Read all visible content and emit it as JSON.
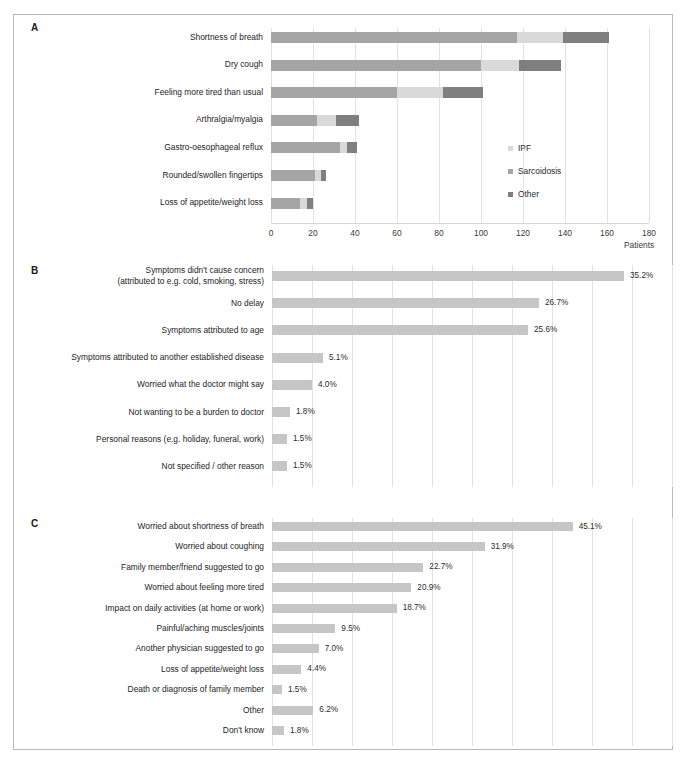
{
  "figure": {
    "background": "#ffffff",
    "border_color": "#b9b9b9"
  },
  "panels": {
    "a": {
      "letter": "A"
    },
    "b": {
      "letter": "B"
    },
    "c": {
      "letter": "C"
    }
  },
  "colors": {
    "ipf": "#d9d9d9",
    "sarcoidosis": "#a5a5a5",
    "other": "#7f7f7f",
    "single_bar": "#c6c6c6",
    "gridline": "#e2e2e2",
    "axis": "#d6d6d6",
    "text": "#252525"
  },
  "legend": {
    "items": [
      {
        "label": "IPF",
        "color": "#d9d9d9"
      },
      {
        "label": "Sarcoidosis",
        "color": "#a5a5a5"
      },
      {
        "label": "Other",
        "color": "#7f7f7f"
      }
    ]
  },
  "chart_data": [
    {
      "panel": "A",
      "type": "bar",
      "orientation": "horizontal",
      "stacked": true,
      "title": "",
      "xlabel": "Patients",
      "ylabel": "",
      "xlim": [
        0,
        180
      ],
      "xticks": [
        0,
        20,
        40,
        60,
        80,
        100,
        120,
        140,
        160,
        180
      ],
      "grid": true,
      "legend_position": "right",
      "categories": [
        "Shortness of breath",
        "Dry cough",
        "Feeling more tired than usual",
        "Arthralgia/myalgia",
        "Gastro-oesophageal reflux",
        "Rounded/swollen fingertips",
        "Loss of appetite/weight loss"
      ],
      "series": [
        {
          "name": "Sarcoidosis",
          "color": "#a5a5a5",
          "values": [
            117,
            100,
            60,
            22,
            33,
            21,
            14
          ]
        },
        {
          "name": "IPF",
          "color": "#d9d9d9",
          "values": [
            22,
            18,
            22,
            9,
            3,
            3,
            3
          ]
        },
        {
          "name": "Other",
          "color": "#7f7f7f",
          "values": [
            22,
            20,
            19,
            11,
            5,
            2,
            3
          ]
        }
      ],
      "series_order_note": "Rendered left-to-right as Sarcoidosis, IPF, Other"
    },
    {
      "panel": "B",
      "type": "bar",
      "orientation": "horizontal",
      "stacked": false,
      "title": "",
      "xlabel": "",
      "ylabel": "",
      "xlim": [
        0,
        40
      ],
      "grid": true,
      "legend_position": "none",
      "bar_color": "#c6c6c6",
      "categories": [
        "Symptoms didn't cause concern\n(attributed to e.g. cold, smoking, stress)",
        "No delay",
        "Symptoms attributed to age",
        "Symptoms attributed to another established disease",
        "Worried what the doctor might say",
        "Not wanting to be a burden to doctor",
        "Personal reasons (e.g. holiday, funeral, work)",
        "Not specified / other reason"
      ],
      "values": [
        35.2,
        26.7,
        25.6,
        5.1,
        4.0,
        1.8,
        1.5,
        1.5
      ],
      "value_labels": [
        "35.2%",
        "26.7%",
        "25.6%",
        "5.1%",
        "4.0%",
        "1.8%",
        "1.5%",
        "1.5%"
      ]
    },
    {
      "panel": "C",
      "type": "bar",
      "orientation": "horizontal",
      "stacked": false,
      "title": "",
      "xlabel": "",
      "ylabel": "",
      "xlim": [
        0,
        60
      ],
      "grid": true,
      "legend_position": "none",
      "bar_color": "#c6c6c6",
      "categories": [
        "Worried about shortness of breath",
        "Worried about coughing",
        "Family member/friend suggested to go",
        "Worried about feeling more tired",
        "Impact on daily activities (at home or work)",
        "Painful/aching muscles/joints",
        "Another physician suggested to go",
        "Loss of appetite/weight loss",
        "Death or diagnosis of family member",
        "Other",
        "Don't know"
      ],
      "values": [
        45.1,
        31.9,
        22.7,
        20.9,
        18.7,
        9.5,
        7.0,
        4.4,
        1.5,
        6.2,
        1.8
      ],
      "value_labels": [
        "45.1%",
        "31.9%",
        "22.7%",
        "20.9%",
        "18.7%",
        "9.5%",
        "7.0%",
        "4.4%",
        "1.5%",
        "6.2%",
        "1.8%"
      ]
    }
  ],
  "axis_a": {
    "tick_labels": [
      "0",
      "20",
      "40",
      "60",
      "80",
      "100",
      "120",
      "140",
      "160",
      "180"
    ],
    "title": "Patients"
  }
}
